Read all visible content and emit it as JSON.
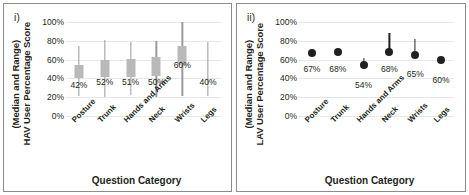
{
  "figure": {
    "background": "#ffffff",
    "frame_color": "#8c8c8c"
  },
  "panels": [
    {
      "key": "i",
      "label": "i)",
      "ylabel_line1": "HAV User Percentage Score",
      "ylabel_line2": "(Median and Range)",
      "xlabel": "Question Category"
    },
    {
      "key": "ii",
      "label": "ii)",
      "ylabel_line1": "LAV User Percentage Score",
      "ylabel_line2": "(Median and Range)",
      "xlabel": "Question Category"
    }
  ],
  "axis": {
    "yticks": [
      "0%",
      "20%",
      "40%",
      "60%",
      "80%",
      "100%"
    ],
    "ytick_values": [
      0,
      20,
      40,
      60,
      80,
      100
    ],
    "ymin": 0,
    "ymax": 100,
    "categories": [
      "Posture",
      "Trunk",
      "Hands and Arms",
      "Neck",
      "Wrists",
      "Legs"
    ]
  },
  "colors": {
    "box_fill": "#b9b9b9",
    "whisker_grey": "#9a9a9a",
    "dot_dark": "#231f20",
    "gridline": "#e8e8e8",
    "text": "#231f20"
  },
  "chart_data": [
    {
      "type": "bar",
      "id": "panel-i",
      "title": "i)",
      "xlabel": "Question Category",
      "ylabel": "HAV User Percentage Score (Median and Range)",
      "ylim": [
        0,
        100
      ],
      "ytick_labels": [
        "0%",
        "20%",
        "40%",
        "60%",
        "80%",
        "100%"
      ],
      "grid": true,
      "legend": "none",
      "categories": [
        "Posture",
        "Trunk",
        "Hands and Arms",
        "Neck",
        "Wrists",
        "Legs"
      ],
      "median_values": [
        42,
        52,
        51,
        50,
        60,
        40
      ],
      "data_labels": [
        "42%",
        "52%",
        "51%",
        "50%",
        "60%",
        "40%"
      ],
      "box_low": [
        40,
        41,
        42,
        43,
        54,
        null
      ],
      "box_high": [
        54,
        60,
        61,
        63,
        74,
        null
      ],
      "range_min": [
        21,
        20,
        22,
        20,
        21,
        21
      ],
      "range_max": [
        74,
        81,
        79,
        80,
        100,
        79
      ]
    },
    {
      "type": "scatter",
      "id": "panel-ii",
      "title": "ii)",
      "xlabel": "Question Category",
      "ylabel": "LAV User Percentage Score (Median and Range)",
      "ylim": [
        0,
        100
      ],
      "ytick_labels": [
        "0%",
        "20%",
        "40%",
        "60%",
        "80%",
        "100%"
      ],
      "grid": true,
      "legend": "none",
      "categories": [
        "Posture",
        "Trunk",
        "Hands and Arms",
        "Neck",
        "Wrists",
        "Legs"
      ],
      "median_values": [
        67,
        68,
        54,
        68,
        65,
        60
      ],
      "data_labels": [
        "67%",
        "68%",
        "54%",
        "68%",
        "65%",
        "60%"
      ],
      "range_min": [
        67,
        68,
        54,
        68,
        65,
        60
      ],
      "range_max": [
        67,
        68,
        62,
        88,
        82,
        60
      ]
    }
  ]
}
